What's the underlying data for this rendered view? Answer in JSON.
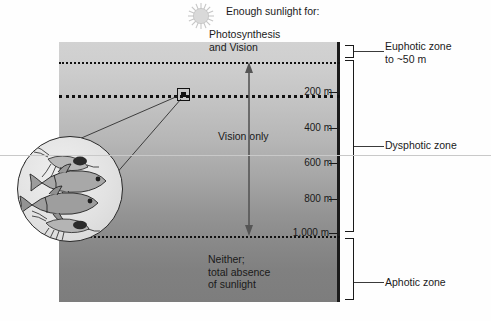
{
  "figure": {
    "sun_icon": "sun-icon",
    "heading": "Enough sunlight for:"
  },
  "annotations": {
    "photosynthesis": "Photosynthesis\nand Vision",
    "vision_only": "Vision only",
    "neither": "Neither;\ntotal absence\nof sunlight"
  },
  "depth_scale": {
    "unit": "m",
    "ticks": [
      {
        "label": "200 m",
        "depth": 200,
        "y": 92
      },
      {
        "label": "400 m",
        "depth": 400,
        "y": 128
      },
      {
        "label": "600 m",
        "depth": 600,
        "y": 163
      },
      {
        "label": "800 m",
        "depth": 800,
        "y": 199
      },
      {
        "label": "1,000 m",
        "depth": 1000,
        "y": 233
      }
    ]
  },
  "zones": [
    {
      "name": "euphotic",
      "label": "Euphotic zone\nto ~50 m",
      "top_depth": 0,
      "bottom_depth": 50
    },
    {
      "name": "dysphotic",
      "label": "Dysphotic zone",
      "top_depth": 50,
      "bottom_depth": 1000
    },
    {
      "name": "aphotic",
      "label": "Aphotic zone",
      "top_depth": 1000,
      "bottom_depth": 2000
    }
  ],
  "boundaries": [
    {
      "name": "euphotic-base",
      "label": "~50 m",
      "y": 62,
      "weight": "thin"
    },
    {
      "name": "200m-line",
      "label": "200 m",
      "y": 95,
      "weight": "thick"
    },
    {
      "name": "aphotic-top",
      "label": "1,000 m",
      "y": 236,
      "weight": "thin"
    }
  ],
  "inset": {
    "name": "magnified-organisms-inset",
    "contents": [
      "fish",
      "fish",
      "shrimp",
      "shrimp"
    ]
  },
  "arrow": {
    "name": "vision-range-arrow",
    "from_depth": 50,
    "to_depth": 1000
  },
  "colors": {
    "surface_water": "#d2d2d2",
    "deep_water": "#7d7d7d",
    "ink": "#1a1a1a",
    "border": "#1b1b1b"
  }
}
